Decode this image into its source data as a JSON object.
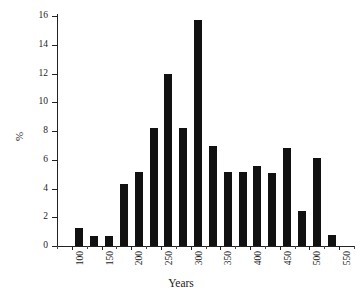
{
  "chart_data": {
    "type": "bar",
    "title": "",
    "xlabel": "Years",
    "ylabel": "%",
    "xlim": [
      75,
      575
    ],
    "ylim": [
      0,
      16
    ],
    "ytick_labels": [
      "0",
      "2",
      "4",
      "6",
      "8",
      "10",
      "12",
      "14",
      "16"
    ],
    "ytick_values": [
      0,
      2,
      4,
      6,
      8,
      10,
      12,
      14,
      16
    ],
    "xtick_labels": [
      "100",
      "150",
      "200",
      "250",
      "300",
      "350",
      "400",
      "450",
      "500",
      "550"
    ],
    "xtick_values": [
      100,
      150,
      200,
      250,
      300,
      350,
      400,
      450,
      500,
      550
    ],
    "grid": false,
    "legend": false,
    "bar_color": "#111111",
    "bin_width": 25,
    "categories": [
      "112.5",
      "137.5",
      "162.5",
      "187.5",
      "212.5",
      "237.5",
      "262.5",
      "287.5",
      "312.5",
      "337.5",
      "362.5",
      "387.5",
      "412.5",
      "437.5",
      "462.5",
      "487.5",
      "512.5",
      "537.5"
    ],
    "x": [
      112.5,
      137.5,
      162.5,
      187.5,
      212.5,
      237.5,
      262.5,
      287.5,
      312.5,
      337.5,
      362.5,
      387.5,
      412.5,
      437.5,
      462.5,
      487.5,
      512.5,
      537.5
    ],
    "values": [
      1.25,
      0.7,
      0.7,
      4.3,
      5.15,
      8.2,
      11.95,
      8.2,
      15.75,
      6.95,
      5.15,
      5.15,
      5.6,
      5.05,
      6.85,
      2.45,
      6.15,
      0.75
    ]
  },
  "figure": {
    "background": "#ffffff",
    "axis_color": "#222222"
  }
}
